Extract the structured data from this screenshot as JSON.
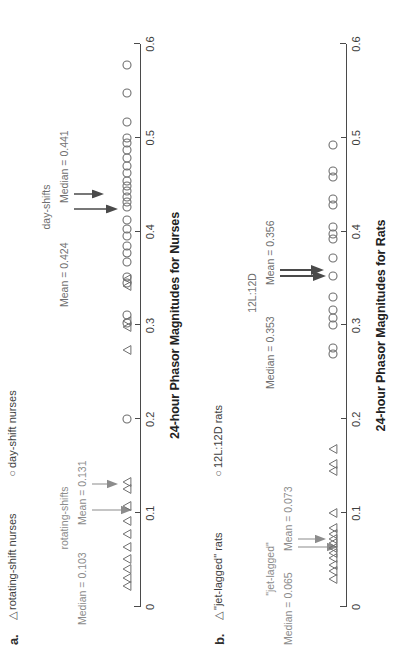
{
  "figure": {
    "orientation": "rotated-90-ccw",
    "background": "#ffffff",
    "text_color": "#404040",
    "annotation_color": "#8c8c8c",
    "marker_color": "#6e6e6e"
  },
  "panels": [
    {
      "letter": "a.",
      "legend": [
        {
          "symbol": "triangle",
          "glyph": "△",
          "label": "rotating-shift nurses"
        },
        {
          "symbol": "circle",
          "glyph": "○",
          "label": "day-shift nurses"
        }
      ],
      "annotations": [
        {
          "name": "rotating-shifts",
          "title": "rotating-shifts",
          "median": "Median = 0.103",
          "mean": "Mean = 0.131"
        },
        {
          "name": "day-shifts",
          "title": "day-shifts",
          "mean": "Mean = 0.424",
          "median": "Median = 0.441"
        }
      ],
      "axis": {
        "title": "24-hour Phasor Magnitudes for Nurses",
        "min": 0,
        "max": 0.6,
        "ticks": [
          0,
          0.1,
          0.2,
          0.3,
          0.4,
          0.5,
          0.6
        ],
        "ticklabels": [
          "0",
          "0.1",
          "0.2",
          "0.3",
          "0.4",
          "0.5",
          "0.6"
        ]
      }
    },
    {
      "letter": "b.",
      "legend": [
        {
          "symbol": "triangle",
          "glyph": "△",
          "label": "\"jet-lagged\" rats"
        },
        {
          "symbol": "circle",
          "glyph": "○",
          "label": "12L:12D rats"
        }
      ],
      "annotations": [
        {
          "name": "jet-lagged",
          "title": "\"jet-lagged\"",
          "median": "Median = 0.065",
          "mean": "Mean = 0.073"
        },
        {
          "name": "12L-12D",
          "title": "12L:12D",
          "median": "Median = 0.353",
          "mean": "Mean = 0.356"
        }
      ],
      "axis": {
        "title": "24-hour Phasor Magnitudes for Rats",
        "min": 0,
        "max": 0.6,
        "ticks": [
          0,
          0.1,
          0.2,
          0.3,
          0.4,
          0.5,
          0.6
        ],
        "ticklabels": [
          "0",
          "0.1",
          "0.2",
          "0.3",
          "0.4",
          "0.5",
          "0.6"
        ]
      }
    }
  ],
  "chart_data": [
    {
      "type": "scatter",
      "name": "panel-a-nurses",
      "title": "24-hour Phasor Magnitudes for Nurses",
      "xlabel": "24-hour Phasor Magnitudes for Nurses",
      "ylabel": "",
      "xlim": [
        0,
        0.6
      ],
      "xticks": [
        0,
        0.1,
        0.2,
        0.3,
        0.4,
        0.5,
        0.6
      ],
      "grid": false,
      "legend_position": "top",
      "series": [
        {
          "name": "rotating-shift nurses",
          "marker": "triangle",
          "median": 0.103,
          "mean": 0.131,
          "values": [
            0.022,
            0.031,
            0.04,
            0.051,
            0.064,
            0.078,
            0.092,
            0.108,
            0.126,
            0.133,
            0.274,
            0.298,
            0.305,
            0.342,
            0.35
          ]
        },
        {
          "name": "day-shift nurses",
          "marker": "circle",
          "median": 0.441,
          "mean": 0.424,
          "values": [
            0.2,
            0.303,
            0.311,
            0.345,
            0.352,
            0.368,
            0.377,
            0.385,
            0.395,
            0.403,
            0.412,
            0.426,
            0.432,
            0.437,
            0.443,
            0.449,
            0.454,
            0.462,
            0.47,
            0.478,
            0.487,
            0.494,
            0.5,
            0.517,
            0.548,
            0.578
          ]
        }
      ]
    },
    {
      "type": "scatter",
      "name": "panel-b-rats",
      "title": "24-hour Phasor Magnitudes for Rats",
      "xlabel": "24-hour Phasor Magnitudes for Rats",
      "ylabel": "",
      "xlim": [
        0,
        0.6
      ],
      "xticks": [
        0,
        0.1,
        0.2,
        0.3,
        0.4,
        0.5,
        0.6
      ],
      "grid": false,
      "legend_position": "top",
      "series": [
        {
          "name": "\"jet-lagged\" rats",
          "marker": "triangle",
          "median": 0.065,
          "mean": 0.073,
          "values": [
            0.03,
            0.038,
            0.045,
            0.052,
            0.058,
            0.063,
            0.068,
            0.072,
            0.078,
            0.084,
            0.1,
            0.145,
            0.152,
            0.168
          ]
        },
        {
          "name": "12L:12D rats",
          "marker": "circle",
          "median": 0.353,
          "mean": 0.356,
          "values": [
            0.27,
            0.276,
            0.3,
            0.308,
            0.316,
            0.33,
            0.353,
            0.372,
            0.392,
            0.398,
            0.405,
            0.428,
            0.435,
            0.458,
            0.465,
            0.492
          ]
        }
      ]
    }
  ]
}
